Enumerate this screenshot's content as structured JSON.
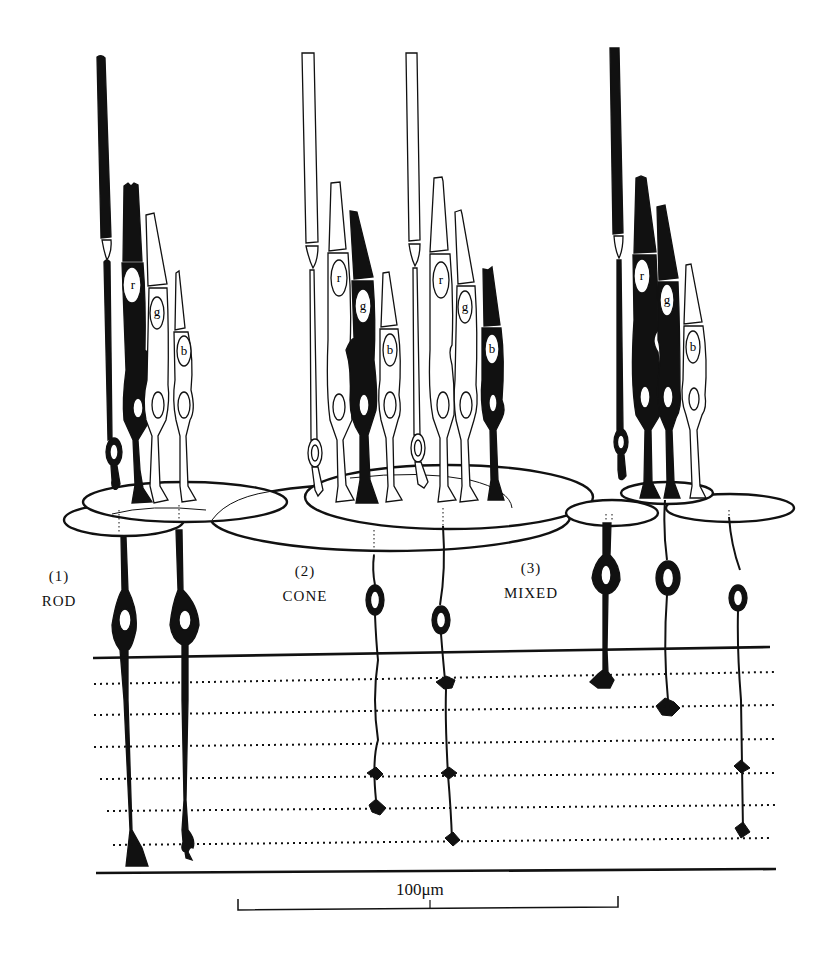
{
  "figure": {
    "type": "retina-schematic",
    "background_color": "#ffffff",
    "ink_color": "#111111"
  },
  "groups": [
    {
      "id": "rod",
      "number": "(1)",
      "name": "ROD",
      "photoreceptors": [
        {
          "kind": "rod",
          "fill": "black"
        },
        {
          "kind": "cone",
          "letter": "r",
          "fill": "black"
        },
        {
          "kind": "cone",
          "letter": "g",
          "fill": "white"
        },
        {
          "kind": "cone",
          "letter": "b",
          "fill": "white"
        }
      ],
      "bipolars": 2
    },
    {
      "id": "cone",
      "number": "(2)",
      "name": "CONE",
      "photoreceptors": [
        {
          "kind": "rod",
          "fill": "white"
        },
        {
          "kind": "cone",
          "letter": "r",
          "fill": "white"
        },
        {
          "kind": "cone",
          "letter": "g",
          "fill": "black"
        },
        {
          "kind": "cone",
          "letter": "b",
          "fill": "white"
        },
        {
          "kind": "rod",
          "fill": "white"
        },
        {
          "kind": "cone",
          "letter": "r",
          "fill": "white"
        },
        {
          "kind": "cone",
          "letter": "g",
          "fill": "white"
        },
        {
          "kind": "cone",
          "letter": "b",
          "fill": "black"
        }
      ],
      "bipolars": 2
    },
    {
      "id": "mixed",
      "number": "(3)",
      "name": "MIXED",
      "photoreceptors": [
        {
          "kind": "rod",
          "fill": "black"
        },
        {
          "kind": "cone",
          "letter": "r",
          "fill": "black"
        },
        {
          "kind": "cone",
          "letter": "g",
          "fill": "black"
        },
        {
          "kind": "cone",
          "letter": "b",
          "fill": "white"
        }
      ],
      "bipolars": 3
    }
  ],
  "cone_letters": {
    "r": "r",
    "g": "g",
    "b": "b"
  },
  "inner_plexiform": {
    "sublamina_count": 6
  },
  "scale_bar": {
    "label": "100μm"
  }
}
